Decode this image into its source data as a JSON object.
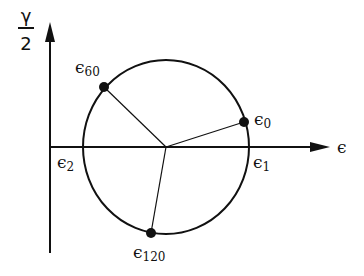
{
  "diagram": {
    "type": "Mohr's circle for strain (rosette)",
    "colors": {
      "ink": "#111111",
      "background": "#ffffff"
    },
    "axes": {
      "x_label": "ϵ",
      "y_label_numerator": "γ",
      "y_label_denominator": "2"
    },
    "points": [
      {
        "symbol": "ϵ",
        "subscript": "0",
        "description": "strain at 0 degrees"
      },
      {
        "symbol": "ϵ",
        "subscript": "60",
        "description": "strain at 60 degrees"
      },
      {
        "symbol": "ϵ",
        "subscript": "120",
        "description": "strain at 120 degrees"
      }
    ],
    "principal_labels": [
      {
        "symbol": "ϵ",
        "subscript": "1"
      },
      {
        "symbol": "ϵ",
        "subscript": "2"
      }
    ]
  }
}
